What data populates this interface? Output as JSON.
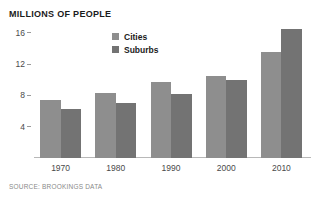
{
  "chart_data": {
    "type": "bar",
    "title": "MILLIONS OF PEOPLE",
    "xlabel": "",
    "ylabel": "",
    "categories": [
      "1970",
      "1980",
      "1990",
      "2000",
      "2010"
    ],
    "series": [
      {
        "name": "Cities",
        "color": "#8e8e8e",
        "values": [
          7.4,
          8.3,
          9.7,
          10.4,
          13.5
        ]
      },
      {
        "name": "Suburbs",
        "color": "#737373",
        "values": [
          6.3,
          7.0,
          8.2,
          10.0,
          16.4
        ]
      }
    ],
    "ylim": [
      0,
      17.6
    ],
    "yticks": [
      16,
      12,
      8,
      4
    ],
    "grid": false,
    "legend_position": "top-center",
    "source": "SOURCE: BROOKINGS DATA"
  },
  "colors": {
    "cities": "#8e8e8e",
    "suburbs": "#737373",
    "axis": "#b8b8b8",
    "tick_text": "#4a4a4a",
    "title_text": "#1b1b1b",
    "source_text": "#8a8a8a",
    "background": "#ffffff"
  }
}
